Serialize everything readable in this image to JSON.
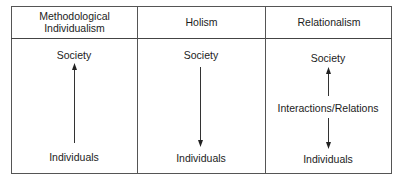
{
  "diagram": {
    "columns": [
      {
        "header": "Methodological Individualism",
        "header_lines": [
          "Methodological",
          "Individualism"
        ],
        "top_label": "Society",
        "bottom_label": "Individuals",
        "arrow": "up (Individuals → Society)"
      },
      {
        "header": "Holism",
        "top_label": "Society",
        "bottom_label": "Individuals",
        "arrow": "down (Society → Individuals)"
      },
      {
        "header": "Relationalism",
        "top_label": "Society",
        "middle_label": "Interactions/Relations",
        "bottom_label": "Individuals",
        "arrows": [
          "up (Interactions/Relations → Society)",
          "down (Interactions/Relations → Individuals)"
        ]
      }
    ],
    "line_color": "#444444",
    "text_color": "#1c1c1c"
  }
}
